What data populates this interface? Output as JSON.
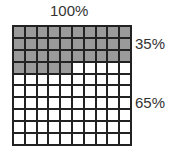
{
  "chart_data": {
    "type": "waffle",
    "title": "100%",
    "grid": {
      "rows": 10,
      "cols": 10
    },
    "series": [
      {
        "name": "35%",
        "value": 35,
        "color": "#9a9a9a"
      },
      {
        "name": "65%",
        "value": 65,
        "color": "#ffffff"
      }
    ]
  },
  "labels": {
    "total": "100%",
    "shaded": "35%",
    "unshaded": "65%"
  }
}
